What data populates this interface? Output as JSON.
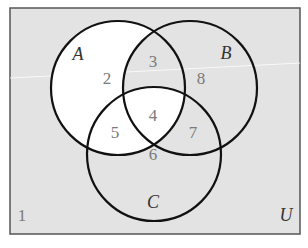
{
  "diagram": {
    "type": "venn-3-sets",
    "universe_label": "U",
    "sets": [
      {
        "name": "A",
        "cx": 118,
        "cy": 88,
        "r": 67
      },
      {
        "name": "B",
        "cx": 190,
        "cy": 88,
        "r": 67
      },
      {
        "name": "C",
        "cx": 154,
        "cy": 154,
        "r": 67
      }
    ],
    "set_labels": [
      {
        "text": "A",
        "x": 78,
        "y": 56
      },
      {
        "text": "B",
        "x": 226,
        "y": 55
      },
      {
        "text": "C",
        "x": 153,
        "y": 204
      },
      {
        "text": "U",
        "x": 286,
        "y": 217
      }
    ],
    "regions": [
      {
        "label": "1",
        "description": "outside all sets",
        "x": 22,
        "y": 217,
        "shaded": true
      },
      {
        "label": "2",
        "description": "A only",
        "x": 107,
        "y": 80,
        "shaded": false
      },
      {
        "label": "3",
        "description": "A and B only",
        "x": 153,
        "y": 63,
        "shaded": true
      },
      {
        "label": "4",
        "description": "A and B and C",
        "x": 153,
        "y": 117,
        "shaded": false
      },
      {
        "label": "5",
        "description": "A and C only",
        "x": 115,
        "y": 134,
        "shaded": false
      },
      {
        "label": "6",
        "description": "C only",
        "x": 153,
        "y": 156,
        "shaded": true
      },
      {
        "label": "7",
        "description": "B and C only",
        "x": 193,
        "y": 134,
        "shaded": true
      },
      {
        "label": "8",
        "description": "B only",
        "x": 201,
        "y": 80,
        "shaded": true
      }
    ],
    "colors": {
      "shaded": "#e3e3e3",
      "unshaded": "#ffffff",
      "outline": "#111111",
      "frame": "#555555",
      "region_number": "#7a7a7a",
      "set_letter": "#333333"
    }
  }
}
